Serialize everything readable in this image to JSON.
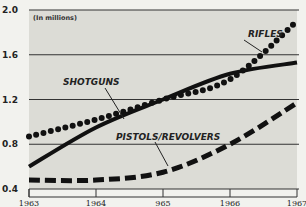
{
  "chart_data": {
    "type": "line",
    "title": "",
    "unit_label": "(In millions)",
    "xlabel": "",
    "ylabel": "",
    "x": [
      "1963",
      "1964",
      "965",
      "1966",
      "1967"
    ],
    "x_years": [
      1963,
      1964,
      1965,
      1966,
      1967
    ],
    "ylim": [
      0.4,
      2.0
    ],
    "yticks": [
      "2.0",
      "1.6",
      "1.2",
      "0.8",
      "0.4"
    ],
    "grid": true,
    "series": [
      {
        "name": "RIFLES",
        "style": "dotted",
        "values": [
          0.87,
          1.02,
          1.2,
          1.38,
          1.9
        ]
      },
      {
        "name": "SHOTGUNS",
        "style": "solid",
        "values": [
          0.6,
          0.95,
          1.2,
          1.43,
          1.53
        ]
      },
      {
        "name": "PISTOLS/REVOLVERS",
        "style": "dashed",
        "values": [
          0.48,
          0.48,
          0.55,
          0.8,
          1.17
        ]
      }
    ],
    "legend": "inline labels with pointer lines"
  }
}
